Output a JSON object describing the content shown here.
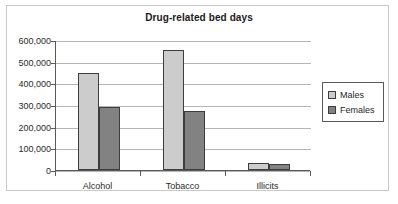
{
  "chart_data": {
    "type": "bar",
    "title": "Drug-related bed days",
    "xlabel": "",
    "ylabel": "",
    "categories": [
      "Alcohol",
      "Tobacco",
      "Illicits"
    ],
    "series": [
      {
        "name": "Males",
        "color": "#cccccc",
        "values": [
          447000,
          552000,
          32000
        ]
      },
      {
        "name": "Females",
        "color": "#828282",
        "values": [
          292000,
          272000,
          30000
        ]
      }
    ],
    "ylim": [
      0,
      600000
    ],
    "ytick_values": [
      0,
      100000,
      200000,
      300000,
      400000,
      500000,
      600000
    ],
    "ytick_labels": [
      "0",
      "100,000",
      "200,000",
      "300,000",
      "400,000",
      "500,000",
      "600,000"
    ],
    "grid": true,
    "legend_position": "right",
    "legend_entries": [
      "Males",
      "Females"
    ]
  },
  "figure": {
    "border_color": "#c9c9c9",
    "axis_color": "#5a5a5a",
    "gridline_color": "#b5b5b5",
    "bar_outline_color": "#3d3d3d"
  }
}
